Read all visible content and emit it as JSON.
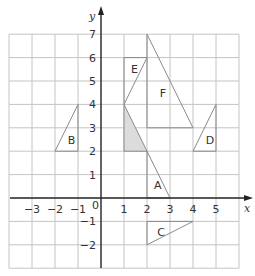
{
  "diagram": {
    "type": "coordinate-grid",
    "x_range": [
      -4,
      6
    ],
    "y_range": [
      -3,
      7
    ],
    "x_axis_label": "x",
    "y_axis_label": "y",
    "origin_label": "0",
    "x_ticks": [
      {
        "value": -3,
        "label": "−3"
      },
      {
        "value": -2,
        "label": "−2"
      },
      {
        "value": -1,
        "label": "−1"
      },
      {
        "value": 1,
        "label": "1"
      },
      {
        "value": 2,
        "label": "2"
      },
      {
        "value": 3,
        "label": "3"
      },
      {
        "value": 4,
        "label": "4"
      },
      {
        "value": 5,
        "label": "5"
      }
    ],
    "y_ticks": [
      {
        "value": 7,
        "label": "7"
      },
      {
        "value": 6,
        "label": "6"
      },
      {
        "value": 5,
        "label": "5"
      },
      {
        "value": 4,
        "label": "4"
      },
      {
        "value": 3,
        "label": "3"
      },
      {
        "value": 2,
        "label": "2"
      },
      {
        "value": 1,
        "label": "1"
      },
      {
        "value": -1,
        "label": "−1"
      },
      {
        "value": -2,
        "label": "−2"
      }
    ],
    "shapes": [
      {
        "name": "shaded-object",
        "label": "",
        "shaded": true,
        "points": [
          [
            1,
            4
          ],
          [
            1,
            2
          ],
          [
            2,
            2
          ]
        ]
      },
      {
        "name": "triangle-A",
        "label": "A",
        "shaded": false,
        "points": [
          [
            2,
            2
          ],
          [
            2,
            0
          ],
          [
            3,
            0
          ]
        ],
        "label_pos": [
          2.3,
          0.55
        ]
      },
      {
        "name": "triangle-B",
        "label": "B",
        "shaded": false,
        "points": [
          [
            -2,
            2
          ],
          [
            -1,
            4
          ],
          [
            -1,
            2
          ]
        ],
        "label_pos": [
          -1.45,
          2.5
        ]
      },
      {
        "name": "triangle-C",
        "label": "C",
        "shaded": false,
        "points": [
          [
            2,
            -1
          ],
          [
            2,
            -2
          ],
          [
            4,
            -1
          ]
        ],
        "label_pos": [
          2.45,
          -1.45
        ]
      },
      {
        "name": "triangle-D",
        "label": "D",
        "shaded": false,
        "points": [
          [
            4,
            2
          ],
          [
            5,
            4
          ],
          [
            5,
            2
          ]
        ],
        "label_pos": [
          4.55,
          2.5
        ]
      },
      {
        "name": "triangle-E",
        "label": "E",
        "shaded": false,
        "points": [
          [
            1,
            4
          ],
          [
            2,
            6
          ],
          [
            1,
            6
          ]
        ],
        "label_pos": [
          1.3,
          5.5
        ]
      },
      {
        "name": "triangle-F",
        "label": "F",
        "shaded": false,
        "points": [
          [
            2,
            7
          ],
          [
            2,
            3
          ],
          [
            4,
            3
          ]
        ],
        "label_pos": [
          2.55,
          4.5
        ]
      }
    ]
  },
  "colors": {
    "grid": "#c4c4c4",
    "axis": "#222222",
    "shape_stroke": "#8a8a8a",
    "shaded_fill": "#dcdcdc"
  }
}
